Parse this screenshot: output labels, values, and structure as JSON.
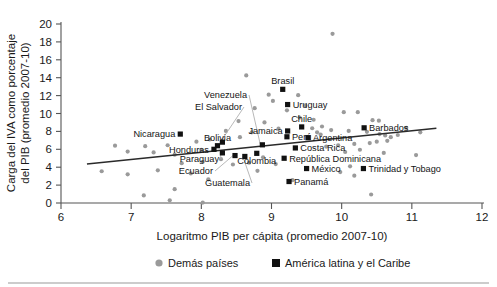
{
  "chart_data": {
    "type": "scatter",
    "title": "",
    "xlabel": "Logaritmo PIB per cápita (promedio 2007-10)",
    "ylabel": "Carga del IVA como porcentaje del PIB (promedio 2007-10)",
    "xlim": [
      6,
      12
    ],
    "ylim": [
      0,
      20
    ],
    "xticks": [
      6,
      7,
      8,
      9,
      10,
      11,
      12
    ],
    "yticks": [
      0,
      2,
      4,
      6,
      8,
      10,
      12,
      14,
      16,
      18,
      20
    ],
    "grid": false,
    "legend_position": "bottom",
    "legend": [
      {
        "label": "Demás países",
        "marker": "circle",
        "color": "#9a9a9a"
      },
      {
        "label": "América latina y el Caribe",
        "marker": "square",
        "color": "#111111"
      }
    ],
    "trendline": {
      "x": [
        6.37,
        11.35
      ],
      "y": [
        4.35,
        8.35
      ]
    },
    "series": [
      {
        "name": "América latina y el Caribe",
        "marker": "square",
        "color": "#111111",
        "points": [
          {
            "label": "Nicaragua",
            "x": 7.7,
            "y": 7.7,
            "label_side": "left"
          },
          {
            "label": "Venezuela",
            "x": 8.87,
            "y": 6.5,
            "label_side": "leader"
          },
          {
            "label": "El Salvador",
            "x": 8.3,
            "y": 6.8,
            "label_side": "leader"
          },
          {
            "label": "Bolivia",
            "x": 8.23,
            "y": 6.4,
            "label_side": "above"
          },
          {
            "label": "Honduras",
            "x": 8.18,
            "y": 6.0,
            "label_side": "left"
          },
          {
            "label": "Paraguay",
            "x": 8.3,
            "y": 5.6,
            "label_side": "leader"
          },
          {
            "label": "Ecuador",
            "x": 8.48,
            "y": 5.3,
            "label_side": "leader"
          },
          {
            "label": "Guatemala",
            "x": 8.62,
            "y": 5.2,
            "label_side": "leader"
          },
          {
            "label": "Colombia",
            "x": 8.79,
            "y": 5.55,
            "label_side": "below"
          },
          {
            "label": "Brasil",
            "x": 9.16,
            "y": 12.7,
            "label_side": "above"
          },
          {
            "label": "Uruguay",
            "x": 9.23,
            "y": 11.0,
            "label_side": "right"
          },
          {
            "label": "Jamaica",
            "x": 9.23,
            "y": 8.05,
            "label_side": "left"
          },
          {
            "label": "Chile",
            "x": 9.43,
            "y": 8.5,
            "label_side": "above"
          },
          {
            "label": "Barbados",
            "x": 10.32,
            "y": 8.4,
            "label_side": "right"
          },
          {
            "label": "Perú",
            "x": 9.22,
            "y": 7.4,
            "label_side": "right"
          },
          {
            "label": "Argentina",
            "x": 9.52,
            "y": 7.3,
            "label_side": "right"
          },
          {
            "label": "Costa Rica",
            "x": 9.34,
            "y": 6.15,
            "label_side": "right"
          },
          {
            "label": "República Dominicana",
            "x": 9.18,
            "y": 5.0,
            "label_side": "right"
          },
          {
            "label": "México",
            "x": 9.5,
            "y": 3.85,
            "label_side": "right"
          },
          {
            "label": "Trinidad y Tobago",
            "x": 10.31,
            "y": 3.85,
            "label_side": "right"
          },
          {
            "label": "Panamá",
            "x": 9.25,
            "y": 2.4,
            "label_side": "right"
          }
        ]
      },
      {
        "name": "Demás países",
        "marker": "circle",
        "color": "#9a9a9a",
        "points": [
          {
            "x": 8.64,
            "y": 14.25
          },
          {
            "x": 9.87,
            "y": 18.9
          },
          {
            "x": 8.53,
            "y": 9.15
          },
          {
            "x": 8.96,
            "y": 12.1
          },
          {
            "x": 9.02,
            "y": 11.4
          },
          {
            "x": 9.38,
            "y": 12.05
          },
          {
            "x": 9.22,
            "y": 10.35
          },
          {
            "x": 10.03,
            "y": 10.15
          },
          {
            "x": 10.23,
            "y": 10.15
          },
          {
            "x": 10.44,
            "y": 9.25
          },
          {
            "x": 10.53,
            "y": 9.2
          },
          {
            "x": 9.72,
            "y": 8.55
          },
          {
            "x": 9.85,
            "y": 8.15
          },
          {
            "x": 9.58,
            "y": 8.35
          },
          {
            "x": 9.65,
            "y": 7.9
          },
          {
            "x": 9.7,
            "y": 7.65
          },
          {
            "x": 10.1,
            "y": 8.05
          },
          {
            "x": 10.36,
            "y": 7.95
          },
          {
            "x": 10.54,
            "y": 7.7
          },
          {
            "x": 10.62,
            "y": 7.55
          },
          {
            "x": 10.7,
            "y": 7.35
          },
          {
            "x": 10.8,
            "y": 7.6
          },
          {
            "x": 10.65,
            "y": 6.95
          },
          {
            "x": 10.5,
            "y": 6.85
          },
          {
            "x": 10.4,
            "y": 6.7
          },
          {
            "x": 10.18,
            "y": 6.6
          },
          {
            "x": 9.95,
            "y": 6.45
          },
          {
            "x": 9.78,
            "y": 6.3
          },
          {
            "x": 10.26,
            "y": 5.95
          },
          {
            "x": 10.05,
            "y": 5.7
          },
          {
            "x": 10.6,
            "y": 5.6
          },
          {
            "x": 11.06,
            "y": 5.35
          },
          {
            "x": 10.12,
            "y": 4.1
          },
          {
            "x": 9.98,
            "y": 3.45
          },
          {
            "x": 10.18,
            "y": 3.05
          },
          {
            "x": 10.92,
            "y": 8.4
          },
          {
            "x": 11.12,
            "y": 7.9
          },
          {
            "x": 9.6,
            "y": 9.3
          },
          {
            "x": 9.4,
            "y": 9.55
          },
          {
            "x": 8.9,
            "y": 9.0
          },
          {
            "x": 9.1,
            "y": 8.3
          },
          {
            "x": 8.72,
            "y": 7.9
          },
          {
            "x": 8.35,
            "y": 8.05
          },
          {
            "x": 8.55,
            "y": 7.35
          },
          {
            "x": 8.12,
            "y": 7.1
          },
          {
            "x": 7.93,
            "y": 6.85
          },
          {
            "x": 7.52,
            "y": 6.45
          },
          {
            "x": 7.2,
            "y": 6.35
          },
          {
            "x": 6.77,
            "y": 6.4
          },
          {
            "x": 6.95,
            "y": 5.75
          },
          {
            "x": 7.32,
            "y": 5.65
          },
          {
            "x": 7.62,
            "y": 5.4
          },
          {
            "x": 8.0,
            "y": 5.95
          },
          {
            "x": 8.28,
            "y": 4.9
          },
          {
            "x": 8.02,
            "y": 4.6
          },
          {
            "x": 7.72,
            "y": 4.45
          },
          {
            "x": 8.45,
            "y": 4.3
          },
          {
            "x": 8.68,
            "y": 4.5
          },
          {
            "x": 6.58,
            "y": 3.55
          },
          {
            "x": 6.95,
            "y": 3.2
          },
          {
            "x": 7.38,
            "y": 3.65
          },
          {
            "x": 7.85,
            "y": 3.3
          },
          {
            "x": 8.1,
            "y": 2.65
          },
          {
            "x": 8.88,
            "y": 5.1
          },
          {
            "x": 9.06,
            "y": 4.35
          },
          {
            "x": 8.8,
            "y": 3.6
          },
          {
            "x": 9.3,
            "y": 2.55
          },
          {
            "x": 7.62,
            "y": 1.55
          },
          {
            "x": 7.18,
            "y": 0.85
          },
          {
            "x": 7.55,
            "y": 0.3
          },
          {
            "x": 8.02,
            "y": 0.05
          },
          {
            "x": 10.42,
            "y": 0.95
          },
          {
            "x": 9.48,
            "y": 10.9
          },
          {
            "x": 8.76,
            "y": 10.6
          }
        ]
      }
    ]
  },
  "axis": {
    "y_title_line1": "Carga del IVA como porcentaje",
    "y_title_line2": "del PIB (promedio 2007-10)",
    "x_title": "Logaritmo PIB per cápita (promedio 2007-10)"
  }
}
